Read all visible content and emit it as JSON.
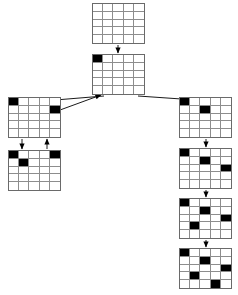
{
  "diagram": {
    "type": "search-tree",
    "board_size": 5,
    "grid_line_color": "#8d8d8d",
    "border_color": "#6a6a6a",
    "filled_cell_color": "#000000",
    "empty_cell_color": "#ffffff",
    "background_color": "#ffffff",
    "nodes": [
      {
        "id": "root",
        "name": "root-empty-board",
        "x": 92,
        "y": 3,
        "w": 53,
        "h": 41,
        "queens": []
      },
      {
        "id": "n1",
        "name": "board-level1",
        "x": 92,
        "y": 54,
        "w": 53,
        "h": 41,
        "queens": [
          [
            0,
            0
          ]
        ]
      },
      {
        "id": "n2l",
        "name": "board-left-branch-level2",
        "x": 8,
        "y": 97,
        "w": 53,
        "h": 41,
        "queens": [
          [
            0,
            0
          ],
          [
            1,
            4
          ]
        ]
      },
      {
        "id": "n3l",
        "name": "board-left-branch-level3",
        "x": 8,
        "y": 150,
        "w": 53,
        "h": 41,
        "queens": [
          [
            0,
            0
          ],
          [
            0,
            4
          ],
          [
            1,
            1
          ]
        ]
      },
      {
        "id": "n2r",
        "name": "board-right-branch-level2",
        "x": 179,
        "y": 97,
        "w": 53,
        "h": 41,
        "queens": [
          [
            0,
            0
          ],
          [
            1,
            2
          ]
        ]
      },
      {
        "id": "n3r",
        "name": "board-right-branch-level3",
        "x": 179,
        "y": 148,
        "w": 53,
        "h": 41,
        "queens": [
          [
            0,
            0
          ],
          [
            1,
            2
          ],
          [
            2,
            4
          ]
        ]
      },
      {
        "id": "n4r",
        "name": "board-right-branch-level4",
        "x": 179,
        "y": 198,
        "w": 53,
        "h": 41,
        "queens": [
          [
            0,
            0
          ],
          [
            1,
            2
          ],
          [
            2,
            4
          ],
          [
            3,
            1
          ]
        ]
      },
      {
        "id": "n5r",
        "name": "board-right-branch-level5-solution",
        "x": 179,
        "y": 248,
        "w": 53,
        "h": 41,
        "queens": [
          [
            0,
            0
          ],
          [
            1,
            2
          ],
          [
            2,
            4
          ],
          [
            3,
            1
          ],
          [
            4,
            3
          ]
        ]
      }
    ],
    "edges": [
      {
        "name": "edge-root-to-level1",
        "x1": 118,
        "y1": 45,
        "x2": 118,
        "y2": 53,
        "direction": "down"
      },
      {
        "name": "edge-level1-to-left-level2",
        "x1": 104,
        "y1": 96,
        "x2": 43,
        "y2": 101,
        "direction": "down-left"
      },
      {
        "name": "edge-left-level2-backtrack",
        "x1": 60,
        "y1": 110,
        "x2": 101,
        "y2": 95,
        "direction": "up-right"
      },
      {
        "name": "edge-level1-to-right-level2",
        "x1": 138,
        "y1": 96,
        "x2": 196,
        "y2": 100,
        "direction": "down-right"
      },
      {
        "name": "edge-left-level2-to-level3",
        "x1": 22,
        "y1": 139,
        "x2": 22,
        "y2": 149,
        "direction": "down"
      },
      {
        "name": "edge-left-level3-backtrack",
        "x1": 47,
        "y1": 149,
        "x2": 47,
        "y2": 139,
        "direction": "up"
      },
      {
        "name": "edge-right-level2-to-level3",
        "x1": 206,
        "y1": 139,
        "x2": 206,
        "y2": 147,
        "direction": "down"
      },
      {
        "name": "edge-right-level3-to-level4",
        "x1": 206,
        "y1": 190,
        "x2": 206,
        "y2": 197,
        "direction": "down"
      },
      {
        "name": "edge-right-level4-to-level5",
        "x1": 206,
        "y1": 240,
        "x2": 206,
        "y2": 247,
        "direction": "down"
      }
    ]
  }
}
